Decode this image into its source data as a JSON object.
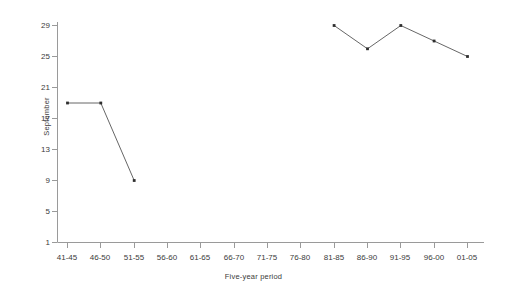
{
  "chart_data": {
    "type": "line",
    "title": "",
    "xlabel": "Five-year period",
    "ylabel": "September",
    "categories": [
      "41-45",
      "46-50",
      "51-55",
      "56-60",
      "61-65",
      "66-70",
      "71-75",
      "76-80",
      "81-85",
      "86-90",
      "91-95",
      "96-00",
      "01-05"
    ],
    "yticks": [
      1,
      5,
      9,
      13,
      17,
      21,
      25,
      29
    ],
    "ylim": [
      1,
      30
    ],
    "grid": false,
    "legend": "none",
    "marker": "filled-square",
    "line_color": "#555555",
    "series": [
      {
        "name": "September",
        "values": [
          19,
          19,
          9,
          null,
          null,
          null,
          null,
          null,
          29,
          26,
          29,
          27,
          25
        ]
      }
    ]
  },
  "axes": {
    "y_axis_label": "September",
    "x_axis_label": "Five-year period"
  }
}
